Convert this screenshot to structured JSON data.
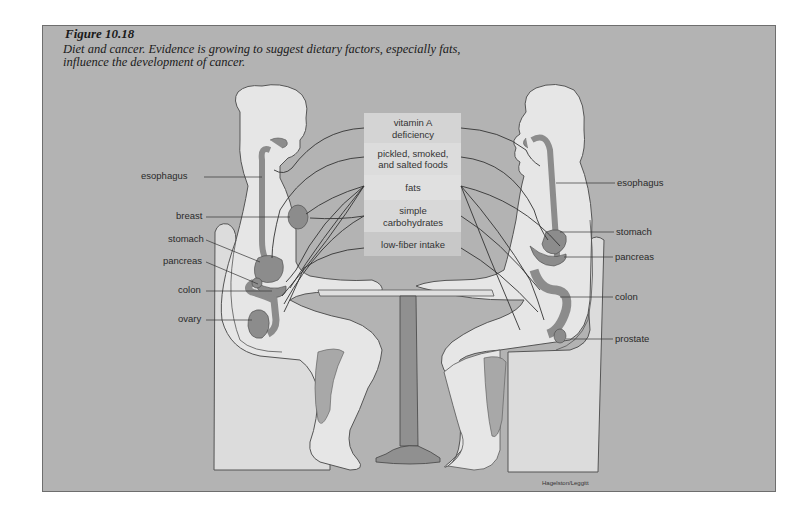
{
  "figure": {
    "number": "Figure 10.18",
    "caption": "Diet and cancer. Evidence is growing to suggest dietary factors, especially fats, influence the development of cancer."
  },
  "dietary_factors": [
    "vitamin A",
    "deficiency",
    "pickled, smoked,",
    "and salted foods",
    "fats",
    "simple",
    "carbohydrates",
    "low-fiber intake"
  ],
  "left_figure_labels": [
    "esophagus",
    "breast",
    "stomach",
    "pancreas",
    "colon",
    "ovary"
  ],
  "right_figure_labels": [
    "esophagus",
    "stomach",
    "pancreas",
    "colon",
    "prostate"
  ],
  "credit": "Hagelston/Leggitt",
  "colors": {
    "background": "#b3b3b3",
    "body": "#e6e6e6",
    "organ": "#8c8c8c",
    "chair": "#dcdcdc",
    "factor_box": "#d0d0d0",
    "factor_box_alt": "#dadada"
  }
}
